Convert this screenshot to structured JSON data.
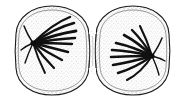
{
  "figure": {
    "title": "Cytokinesis — two daughter cells separating",
    "style": "black ink line drawing with stippled shading on white background",
    "background_color": "#ffffff",
    "ink_color": "#1a1a1a",
    "stipple_color": "#5a5a5a",
    "width": 185,
    "height": 104
  },
  "cells": [
    {
      "id": "left-daughter-cell",
      "label": "left daughter cell",
      "center_x": 52,
      "center_y": 50,
      "radius_x": 37,
      "radius_y": 44,
      "membrane_color": "#1a1a1a",
      "cortex_color": "#6b6b6b",
      "spindle": {
        "id": "left-spindle",
        "pole_x": 33,
        "pole_y": 43,
        "direction": "fibers radiate rightward from pole",
        "fiber_count": 9,
        "fiber_color": "#111111",
        "fibers": [
          {
            "end_x": 70,
            "end_y": 17,
            "ctrl_x": 52,
            "ctrl_y": 24
          },
          {
            "end_x": 74,
            "end_y": 23,
            "ctrl_x": 55,
            "ctrl_y": 28
          },
          {
            "end_x": 76,
            "end_y": 31,
            "ctrl_x": 56,
            "ctrl_y": 34
          },
          {
            "end_x": 75,
            "end_y": 38,
            "ctrl_x": 56,
            "ctrl_y": 39
          },
          {
            "end_x": 72,
            "end_y": 44,
            "ctrl_x": 54,
            "ctrl_y": 43
          },
          {
            "end_x": 68,
            "end_y": 52,
            "ctrl_x": 52,
            "ctrl_y": 48
          },
          {
            "end_x": 62,
            "end_y": 60,
            "ctrl_x": 48,
            "ctrl_y": 53
          },
          {
            "end_x": 54,
            "end_y": 68,
            "ctrl_x": 43,
            "ctrl_y": 57
          },
          {
            "end_x": 45,
            "end_y": 73,
            "ctrl_x": 38,
            "ctrl_y": 59
          }
        ]
      }
    },
    {
      "id": "right-daughter-cell",
      "label": "right daughter cell",
      "center_x": 133,
      "center_y": 50,
      "radius_x": 37,
      "radius_y": 44,
      "membrane_color": "#1a1a1a",
      "cortex_color": "#6b6b6b",
      "spindle": {
        "id": "right-spindle",
        "pole_x": 152,
        "pole_y": 56,
        "direction": "fibers radiate leftward from pole",
        "fiber_count": 9,
        "fiber_color": "#111111",
        "fibers": [
          {
            "end_x": 140,
            "end_y": 26,
            "ctrl_x": 147,
            "ctrl_y": 40
          },
          {
            "end_x": 132,
            "end_y": 30,
            "ctrl_x": 143,
            "ctrl_y": 41
          },
          {
            "end_x": 124,
            "end_y": 35,
            "ctrl_x": 139,
            "ctrl_y": 43
          },
          {
            "end_x": 116,
            "end_y": 43,
            "ctrl_x": 134,
            "ctrl_y": 47
          },
          {
            "end_x": 112,
            "end_y": 50,
            "ctrl_x": 131,
            "ctrl_y": 51
          },
          {
            "end_x": 111,
            "end_y": 57,
            "ctrl_x": 130,
            "ctrl_y": 56
          },
          {
            "end_x": 113,
            "end_y": 65,
            "ctrl_x": 131,
            "ctrl_y": 62
          },
          {
            "end_x": 118,
            "end_y": 73,
            "ctrl_x": 135,
            "ctrl_y": 68
          },
          {
            "end_x": 127,
            "end_y": 80,
            "ctrl_x": 141,
            "ctrl_y": 73
          }
        ]
      }
    }
  ],
  "cleavage_furrow": {
    "id": "cleavage-furrow",
    "label": "cleavage furrow",
    "x": 92,
    "top_y": 28,
    "bottom_y": 74,
    "waist_width": 6
  }
}
